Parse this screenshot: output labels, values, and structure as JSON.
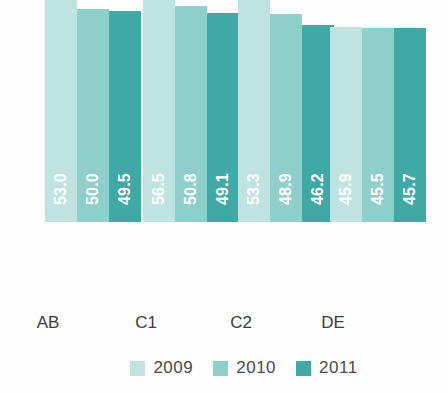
{
  "chart_data": {
    "type": "bar",
    "title": "",
    "subtitle": "",
    "xlabel": "",
    "ylabel": "",
    "categories": [
      "AB",
      "C1",
      "C2",
      "DE"
    ],
    "series": [
      {
        "name": "2009",
        "color": "#bfe3e0",
        "values": [
          53.0,
          56.5,
          53.3,
          45.9
        ]
      },
      {
        "name": "2010",
        "color": "#8ecfcb",
        "values": [
          50.0,
          50.8,
          48.9,
          45.5
        ]
      },
      {
        "name": "2011",
        "color": "#40a9a5",
        "values": [
          49.5,
          49.1,
          46.2,
          45.7
        ]
      }
    ],
    "value_labels": [
      [
        "53.0",
        "50.0",
        "49.5"
      ],
      [
        "56.5",
        "50.8",
        "49.1"
      ],
      [
        "53.3",
        "48.9",
        "46.2"
      ],
      [
        "45.9",
        "45.5",
        "45.7"
      ]
    ],
    "ylim": [
      0,
      63
    ],
    "grid": false,
    "legend_position": "bottom-right",
    "legend": [
      "2009",
      "2010",
      "2011"
    ]
  },
  "colors": {
    "series_2009": "#bfe3e0",
    "series_2010": "#8ecfcb",
    "series_2011": "#40a9a5",
    "label_text": "#ffffff",
    "axis_text": "#3b3b3b",
    "legend_text": "#4a4a4a",
    "background": "#fdfdfd"
  }
}
